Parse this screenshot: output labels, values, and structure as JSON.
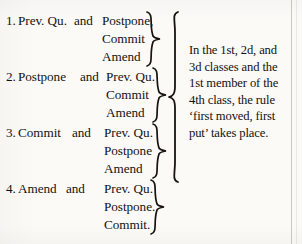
{
  "document": {
    "type": "precedence-of-motions-diagram",
    "ink_color": "#141210",
    "paper_color": "#fbfaf7"
  },
  "groups": [
    {
      "number": "1.",
      "lead_motion": "Prev. Qu.",
      "conjunction": "and",
      "options": [
        "Postpone,",
        "Commit",
        "Amend"
      ]
    },
    {
      "number": "2.",
      "lead_motion": "Postpone",
      "conjunction": "and",
      "options": [
        "Prev. Qu.",
        "Commit",
        "Amend"
      ]
    },
    {
      "number": "3.",
      "lead_motion": "Commit",
      "conjunction": "and",
      "options": [
        "Prev. Qu.",
        "Postpone",
        "Amend"
      ]
    },
    {
      "number": "4.",
      "lead_motion": "Amend",
      "conjunction": "and",
      "options": [
        "Prev. Qu.",
        "Postpone.",
        "Commit."
      ]
    }
  ],
  "note": {
    "lines": [
      "In the 1st, 2d, and",
      "3d classes and the",
      "1st member of the",
      "4th class, the rule",
      "‘first moved, first",
      "put’ takes place."
    ],
    "full_text": "In the 1st, 2d, and 3d classes and the 1st member of the 4th class, the rule ‘first moved, first put’ takes place."
  }
}
